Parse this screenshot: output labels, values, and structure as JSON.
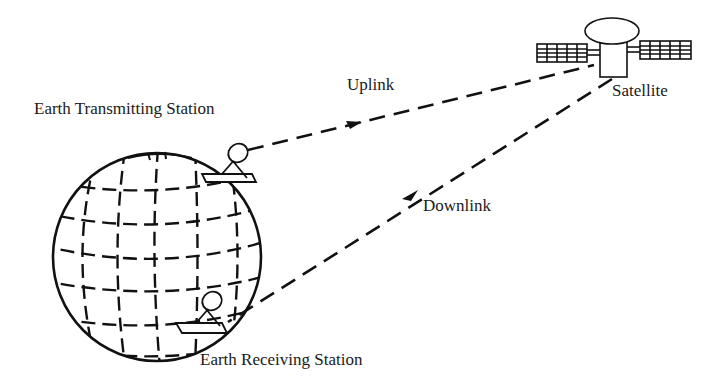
{
  "diagram": {
    "labels": {
      "earth_transmitting_station": "Earth Transmitting Station",
      "earth_receiving_station": "Earth Receiving Station",
      "uplink": "Uplink",
      "downlink": "Downlink",
      "satellite": "Satellite"
    },
    "nodes": [
      {
        "id": "earth",
        "type": "globe"
      },
      {
        "id": "tx_station",
        "type": "dish-antenna",
        "label": "Earth Transmitting Station"
      },
      {
        "id": "rx_station",
        "type": "dish-antenna",
        "label": "Earth Receiving Station"
      },
      {
        "id": "satellite",
        "type": "satellite",
        "label": "Satellite"
      }
    ],
    "edges": [
      {
        "from": "tx_station",
        "to": "satellite",
        "label": "Uplink",
        "style": "dashed",
        "arrow": "toward-satellite"
      },
      {
        "from": "satellite",
        "to": "rx_station",
        "label": "Downlink",
        "style": "dashed",
        "arrow": "toward-earth"
      }
    ],
    "colors": {
      "stroke": "#111111",
      "background": "#ffffff"
    }
  }
}
